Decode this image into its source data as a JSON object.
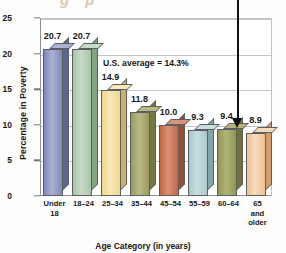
{
  "chart_data": {
    "type": "bar",
    "title": "",
    "xlabel": "Age Category (in years)",
    "ylabel": "Percentage in Poverty",
    "ylim": [
      0,
      25
    ],
    "yticks": [
      0,
      5,
      10,
      15,
      20,
      25
    ],
    "grid": true,
    "legend": "none",
    "categories": [
      "Under\n18",
      "18–24",
      "25–34",
      "35–44",
      "45–54",
      "55–59",
      "60–64",
      "65\nand\nolder"
    ],
    "values": [
      20.7,
      20.7,
      14.9,
      11.8,
      10.0,
      9.3,
      9.4,
      8.9
    ],
    "value_labels": [
      "20.7",
      "20.7",
      "14.9",
      "11.8",
      "10.0",
      "9.3",
      "9.4",
      "8.9"
    ],
    "bar_colors": [
      "#7e88b8",
      "#a7c5a6",
      "#f0d68a",
      "#9a9a5e",
      "#c4663f",
      "#a9c8c9",
      "#93964f",
      "#eec193"
    ],
    "bar_top_colors": [
      "#aab1d2",
      "#c6dbc5",
      "#f8e9b8",
      "#b9b985",
      "#d9917a",
      "#c9dedf",
      "#b2b47a",
      "#f6dcbe"
    ],
    "bar_side_colors": [
      "#5c6694",
      "#82a482",
      "#cdb066",
      "#777741",
      "#9c4b2b",
      "#85a6a7",
      "#71742f",
      "#cf9f6e"
    ],
    "annotations": [
      {
        "text": "U.S. average = 14.3%",
        "value": 14.3
      }
    ],
    "pointer": {
      "target_category": "60–64",
      "target_value": 9.4,
      "icon": "down-arrow-icon"
    }
  },
  "title_remnant": "g  p",
  "yticks_text": [
    "25",
    "20",
    "15",
    "10",
    "5",
    "0"
  ]
}
